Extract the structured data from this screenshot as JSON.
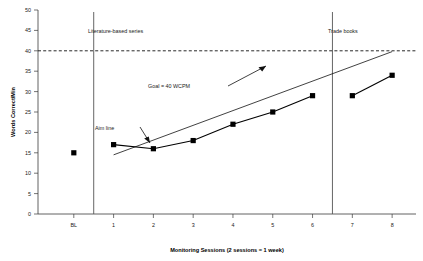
{
  "chart_data": {
    "type": "line",
    "title": "",
    "xlabel": "Monitoring Sessions (2 sessions = 1 week)",
    "ylabel": "Words Correct/Min",
    "x_tick_labels": [
      "BL",
      "1",
      "2",
      "3",
      "4",
      "5",
      "6",
      "7",
      "8"
    ],
    "y_tick_labels": [
      "0",
      "5",
      "10",
      "15",
      "20",
      "25",
      "30",
      "35",
      "40",
      "45",
      "50"
    ],
    "ylim": [
      0,
      50
    ],
    "y_tick_step": 5,
    "grid": false,
    "legend": "none",
    "series": [
      {
        "name": "Baseline",
        "phase": "BL",
        "connected": false,
        "points": [
          {
            "x_label": "BL",
            "x_index": 0,
            "value": 15
          }
        ]
      },
      {
        "name": "Literature-based series",
        "phase": "Literature-based series",
        "connected": true,
        "points": [
          {
            "x_label": "1",
            "x_index": 1,
            "value": 17
          },
          {
            "x_label": "2",
            "x_index": 2,
            "value": 16
          },
          {
            "x_label": "3",
            "x_index": 3,
            "value": 18
          },
          {
            "x_label": "4",
            "x_index": 4,
            "value": 22
          },
          {
            "x_label": "5",
            "x_index": 5,
            "value": 25
          },
          {
            "x_label": "6",
            "x_index": 6,
            "value": 29
          }
        ]
      },
      {
        "name": "Trade books",
        "phase": "Trade books",
        "connected": true,
        "points": [
          {
            "x_label": "7",
            "x_index": 7,
            "value": 29
          },
          {
            "x_label": "8",
            "x_index": 8,
            "value": 34
          }
        ]
      }
    ],
    "reference_lines": [
      {
        "name": "goal-line",
        "style": "dashed",
        "value": 40,
        "orientation": "horizontal",
        "label": "Goal = 40 WCPM"
      },
      {
        "name": "aim-line",
        "style": "solid",
        "orientation": "trend",
        "from": {
          "x_index": 1,
          "value": 14.5
        },
        "to": {
          "x_index": 8,
          "value": 39.8
        },
        "label": "Aim line"
      }
    ],
    "phase_lines": [
      {
        "name": "phase-line-baseline-intervention",
        "between": [
          "BL",
          "1"
        ],
        "x_index": 0.5
      },
      {
        "name": "phase-line-intervention-tradebooks",
        "between": [
          "6",
          "7"
        ],
        "x_index": 6.5
      }
    ],
    "phase_labels": [
      {
        "text": "Literature-based series",
        "x_index": 1.0
      },
      {
        "text": "Trade books",
        "x_index": 6.75
      }
    ],
    "annotations": [
      {
        "name": "goal-annotation",
        "text": "Goal = 40 WCPM",
        "points_to": "goal-line"
      },
      {
        "name": "aim-line-annotation",
        "text": "Aim line",
        "points_to": "aim-line"
      }
    ]
  },
  "colors": {
    "background": "#ffffff",
    "axis": "#3a3a3a",
    "marker": "#000000",
    "data_line": "#000000",
    "goal_line": "#111111",
    "aim_line": "#111111",
    "phase_line": "#555555",
    "text": "#1a1a1a"
  }
}
